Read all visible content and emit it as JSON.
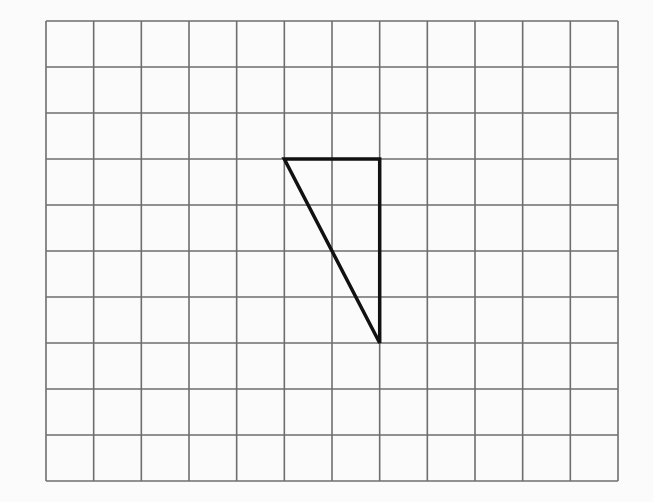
{
  "diagram": {
    "type": "grid-with-triangle",
    "grid": {
      "columns": 12,
      "rows": 10,
      "x0": 46,
      "y0": 21,
      "x1": 618,
      "y1": 481,
      "line_color": "#6e6e6e",
      "background": "#fbfbfb"
    },
    "triangle": {
      "vertices_grid": [
        [
          5,
          3
        ],
        [
          7,
          3
        ],
        [
          7,
          7
        ]
      ],
      "stroke": "#111111",
      "stroke_width": 3.5,
      "description": "Right triangle with legs 2 units (horizontal) and 4 units (vertical)"
    }
  }
}
